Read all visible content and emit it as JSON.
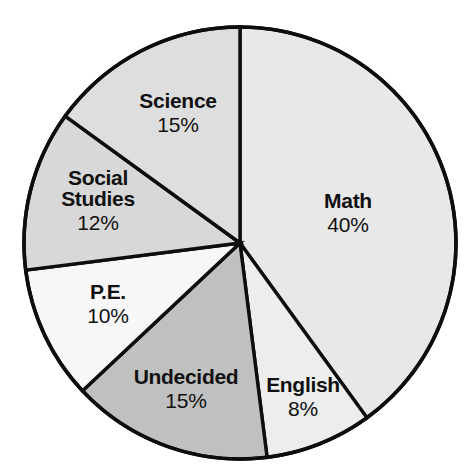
{
  "title": "",
  "title_note": "title-cropped-illegible",
  "colors": {
    "background": "#ffffff",
    "outline": "#0d0d0d",
    "text": "#111111"
  },
  "geometry": {
    "center_x": 240,
    "center_y": 243,
    "radius": 216,
    "start_angle_deg": 0,
    "direction": "clockwise"
  },
  "chart_data": {
    "type": "pie",
    "title": "",
    "xlabel": "",
    "ylabel": "",
    "grid": false,
    "legend": "none",
    "labels_inside_slices": true,
    "total": 100,
    "units": "%",
    "categories": [
      "Math",
      "English",
      "Undecided",
      "P.E.",
      "Social Studies",
      "Science"
    ],
    "values": [
      40,
      8,
      15,
      10,
      12,
      15
    ],
    "slice_colors": [
      "#e8e8e8",
      "#ededed",
      "#c0c0c0",
      "#f7f7f7",
      "#d8d8d8",
      "#dedede"
    ],
    "slices": [
      {
        "category": "Math",
        "category_lines": [
          "Math"
        ],
        "value": 40,
        "pct_label": "40%",
        "fill": "#e8e8e8",
        "label_x": 348,
        "label_y": 212
      },
      {
        "category": "English",
        "category_lines": [
          "English"
        ],
        "value": 8,
        "pct_label": "8%",
        "fill": "#ededed",
        "label_x": 303,
        "label_y": 396
      },
      {
        "category": "Undecided",
        "category_lines": [
          "Undecided"
        ],
        "value": 15,
        "pct_label": "15%",
        "fill": "#c0c0c0",
        "label_x": 186,
        "label_y": 388
      },
      {
        "category": "P.E.",
        "category_lines": [
          "P.E."
        ],
        "value": 10,
        "pct_label": "10%",
        "fill": "#f7f7f7",
        "label_x": 108,
        "label_y": 303
      },
      {
        "category": "Social Studies",
        "category_lines": [
          "Social",
          "Studies"
        ],
        "value": 12,
        "pct_label": "12%",
        "fill": "#d8d8d8",
        "label_x": 98,
        "label_y": 200
      },
      {
        "category": "Science",
        "category_lines": [
          "Science"
        ],
        "value": 15,
        "pct_label": "15%",
        "fill": "#dedede",
        "label_x": 178,
        "label_y": 112
      }
    ]
  }
}
